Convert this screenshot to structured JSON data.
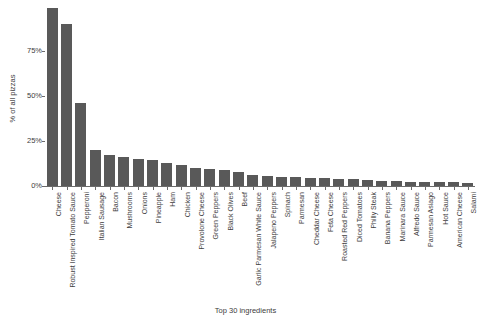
{
  "chart": {
    "y_axis_title": "% of all pizzas",
    "x_axis_title": "Top 30 ingredients",
    "bar_color": "#595959",
    "axis_color": "#6b6b6b",
    "text_color": "#3d3d3d"
  },
  "chart_data": {
    "type": "bar",
    "title": "",
    "xlabel": "Top 30 ingredients",
    "ylabel": "% of all pizzas",
    "ylim": [
      0,
      100
    ],
    "yticks": [
      0,
      25,
      50,
      75
    ],
    "ytick_labels": [
      "0%",
      "25%",
      "50%",
      "75%"
    ],
    "grid": false,
    "legend": null,
    "categories": [
      "Cheese",
      "Robust Inspired Tomato Sauce",
      "Pepperoni",
      "Italian Sausage",
      "Bacon",
      "Mushrooms",
      "Onions",
      "Pineapple",
      "Ham",
      "Chicken",
      "Provolone Cheese",
      "Green Peppers",
      "Black Olives",
      "Beef",
      "Garlic Parmesan White Sauce",
      "Jalapeno Peppers",
      "Spinach",
      "Parmesan",
      "Cheddar Cheese",
      "Feta Cheese",
      "Roasted Red Peppers",
      "Diced Tomatoes",
      "Philly Steak",
      "Banana Peppers",
      "Marinara Sauce",
      "Alfredo Sauce",
      "Parmesan Asiago",
      "Hot Sauce",
      "American Cheese",
      "Salami"
    ],
    "values": [
      99.0,
      90.0,
      46.0,
      20.0,
      17.0,
      16.0,
      15.0,
      14.5,
      13.0,
      11.5,
      10.0,
      9.5,
      9.0,
      8.0,
      6.0,
      5.5,
      5.0,
      5.0,
      4.5,
      4.5,
      4.0,
      4.0,
      3.5,
      3.0,
      3.0,
      2.5,
      2.5,
      2.0,
      2.0,
      1.5
    ]
  }
}
